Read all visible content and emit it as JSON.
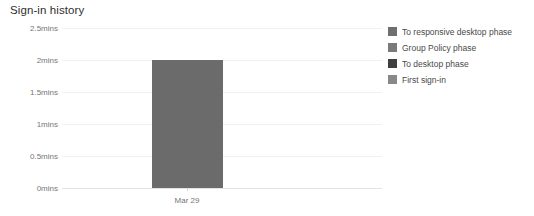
{
  "chart_data": {
    "type": "bar",
    "title": "Sign-in history",
    "xlabel": "",
    "ylabel": "",
    "categories": [
      "Mar 29"
    ],
    "values": [
      2.0
    ],
    "ylim": [
      0,
      2.5
    ],
    "yticks": [
      2.5,
      2,
      1.5,
      1,
      0.5,
      0
    ],
    "ytick_labels": [
      "2.5mins",
      "2mins",
      "1.5mins",
      "1mins",
      "0.5mins",
      "0mins"
    ],
    "grid": true,
    "legend_position": "right",
    "bar_color": "#6b6b6b",
    "series": [
      {
        "name": "To responsive desktop phase",
        "color": "#6f6f6f",
        "values": [
          0
        ]
      },
      {
        "name": "Group Policy phase",
        "color": "#7a7a7a",
        "values": [
          0
        ]
      },
      {
        "name": "To desktop phase",
        "color": "#3f3f3f",
        "values": [
          0
        ]
      },
      {
        "name": "First sign-in",
        "color": "#888888",
        "values": [
          2.0
        ]
      }
    ]
  },
  "legend": {
    "items": [
      {
        "label": "To responsive desktop phase",
        "color": "#6f6f6f"
      },
      {
        "label": "Group Policy phase",
        "color": "#7a7a7a"
      },
      {
        "label": "To desktop phase",
        "color": "#3f3f3f"
      },
      {
        "label": "First sign-in",
        "color": "#888888"
      }
    ]
  }
}
